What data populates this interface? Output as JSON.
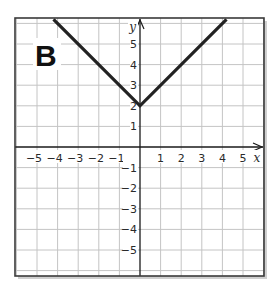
{
  "panel": {
    "label": "B"
  },
  "chart_data": {
    "type": "line",
    "title": "",
    "panel_label": "B",
    "xlabel": "x",
    "ylabel": "y",
    "xlim": [
      -6.2,
      6.0
    ],
    "ylim": [
      -6.3,
      6.3
    ],
    "grid": true,
    "x_ticks": [
      -5,
      -4,
      -3,
      -2,
      -1,
      1,
      2,
      3,
      4,
      5
    ],
    "y_ticks": [
      5,
      4,
      3,
      2,
      1,
      -1,
      -2,
      -3,
      -4,
      -5
    ],
    "x_tick_labels": [
      "−5",
      "−4",
      "−3",
      "−2",
      "−1",
      "1",
      "2",
      "3",
      "4",
      "5"
    ],
    "y_tick_labels": [
      "5",
      "4",
      "3",
      "2",
      "1",
      "−1",
      "−2",
      "−3",
      "−4",
      "−5"
    ],
    "series": [
      {
        "name": "y = |x| + 2",
        "points": [
          [
            -4.2,
            6.2
          ],
          [
            0,
            2
          ],
          [
            4.2,
            6.2
          ]
        ]
      }
    ]
  },
  "style": {
    "frame_color": "#3a3a3a",
    "grid_color": "#c4c4c4",
    "axis_color": "#1a1a1a",
    "line_color": "#222222"
  }
}
